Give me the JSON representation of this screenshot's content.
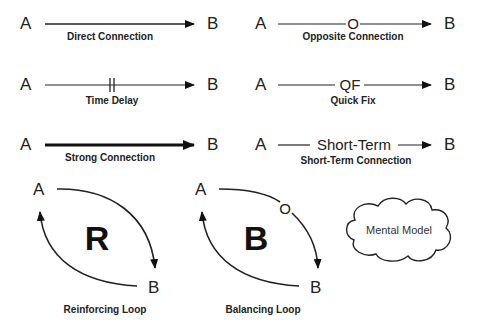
{
  "connections": [
    {
      "id": "direct",
      "from": "A",
      "to": "B",
      "label": "Direct Connection",
      "marker": ""
    },
    {
      "id": "opposite",
      "from": "A",
      "to": "B",
      "label": "Opposite Connection",
      "marker": "O"
    },
    {
      "id": "delay",
      "from": "A",
      "to": "B",
      "label": "Time Delay",
      "marker": "||"
    },
    {
      "id": "quickfix",
      "from": "A",
      "to": "B",
      "label": "Quick Fix",
      "marker": "QF"
    },
    {
      "id": "strong",
      "from": "A",
      "to": "B",
      "label": "Strong Connection",
      "marker": ""
    },
    {
      "id": "shortterm",
      "from": "A",
      "to": "B",
      "label": "Short-Term Connection",
      "marker": "Short-Term"
    }
  ],
  "loops": [
    {
      "id": "reinforcing",
      "from": "A",
      "to": "B",
      "symbol": "R",
      "label": "Reinforcing Loop"
    },
    {
      "id": "balancing",
      "from": "A",
      "to": "B",
      "symbol": "B",
      "marker": "O",
      "label": "Balancing Loop"
    }
  ],
  "mental_model": {
    "label": "Mental Model"
  }
}
